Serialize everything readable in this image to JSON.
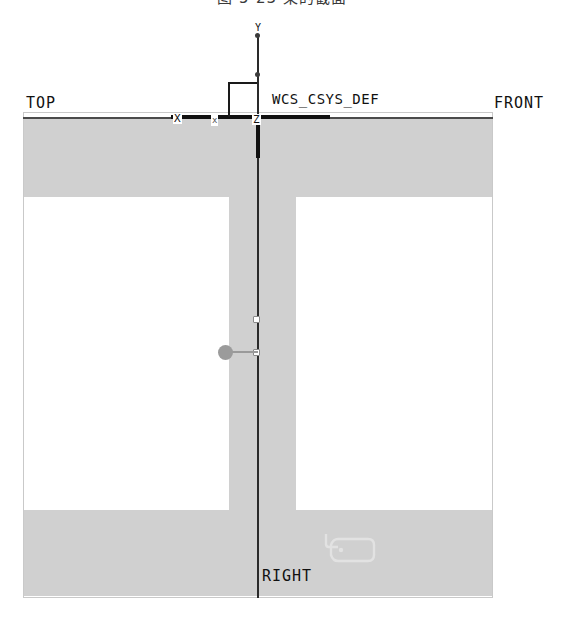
{
  "caption": {
    "text": "图 5-23   梁的截面"
  },
  "drawing": {
    "type": "cad-cross-section",
    "view_labels": {
      "top": "TOP",
      "front": "FRONT",
      "right": "RIGHT"
    },
    "coordinate_system": {
      "name": "WCS_CSYS_DEF",
      "axes": [
        {
          "id": "y",
          "label": "Y"
        },
        {
          "id": "x1",
          "label": "X"
        },
        {
          "id": "x2",
          "label": "x"
        },
        {
          "id": "z",
          "label": "Z"
        }
      ]
    },
    "geometry": {
      "shape": "I-beam",
      "parts": [
        {
          "id": "flange-top",
          "label": "top flange"
        },
        {
          "id": "web",
          "label": "web"
        },
        {
          "id": "flange-bottom",
          "label": "bottom flange"
        }
      ]
    },
    "annotations": [
      {
        "id": "tag-note",
        "label": "note tag symbol"
      },
      {
        "id": "leader-grip",
        "label": "leader grip handle"
      },
      {
        "id": "node-sel-a",
        "label": "selected vertex"
      },
      {
        "id": "node-sel-b",
        "label": "selected vertex"
      }
    ]
  },
  "colors": {
    "solid_fill": "#d0d0d0",
    "datum_line": "#111111",
    "frame_border": "#c9c9c9",
    "grip": "#9b9b9b",
    "tag": "#e0e0e0"
  }
}
